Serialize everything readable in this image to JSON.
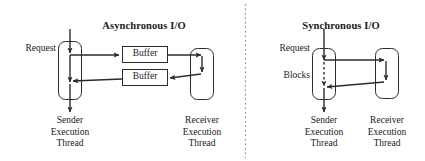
{
  "figure": {
    "kind": "two-panel-io-model-diagram",
    "divider": "vertical-dotted-line"
  },
  "panels": [
    {
      "id": "asynchronous",
      "title": "Asynchronous I/O",
      "request_label": "Request",
      "sender": {
        "label_lines": [
          "Sender",
          "Execution",
          "Thread"
        ],
        "line1": "Sender",
        "line2": "Execution",
        "line3": "Thread"
      },
      "receiver": {
        "label_lines": [
          "Receiver",
          "Execution",
          "Thread"
        ],
        "line1": "Receiver",
        "line2": "Execution",
        "line3": "Thread"
      },
      "buffers": [
        {
          "label": "Buffer"
        },
        {
          "label": "Buffer"
        }
      ]
    },
    {
      "id": "synchronous",
      "title": "Synchronous I/O",
      "request_label": "Request",
      "blocks_label": "Blocks",
      "sender": {
        "label_lines": [
          "Sender",
          "Execution",
          "Thread"
        ],
        "line1": "Sender",
        "line2": "Execution",
        "line3": "Thread"
      },
      "receiver": {
        "label_lines": [
          "Receiver",
          "Execution",
          "Thread"
        ],
        "line1": "Receiver",
        "line2": "Execution",
        "line3": "Thread"
      }
    }
  ],
  "colors": {
    "stroke": "#2b2b2b",
    "background": "#ffffff",
    "text": "#1a1a1a",
    "divider": "#8a8a8a"
  }
}
